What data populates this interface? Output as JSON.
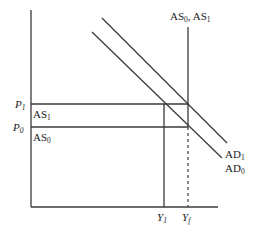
{
  "diagram": {
    "type": "AD-AS economic diagram",
    "axes": {
      "vertical": "price level",
      "horizontal": "output"
    },
    "price_levels": [
      {
        "symbol": "P",
        "sub": "1"
      },
      {
        "symbol": "P",
        "sub": "0"
      }
    ],
    "output_levels": [
      {
        "symbol": "Y",
        "sub": "1"
      },
      {
        "symbol": "Y",
        "sub": "f"
      }
    ],
    "short_run_supply_labels": [
      {
        "symbol": "AS",
        "sub": "1"
      },
      {
        "symbol": "AS",
        "sub": "0"
      }
    ],
    "long_run_supply_label": {
      "symbol1": "AS",
      "sub1": "0",
      "sep": ",",
      "symbol2": " AS",
      "sub2": "1"
    },
    "demand_labels": [
      {
        "symbol": "AD",
        "sub": "1"
      },
      {
        "symbol": "AD",
        "sub": "0"
      }
    ]
  }
}
